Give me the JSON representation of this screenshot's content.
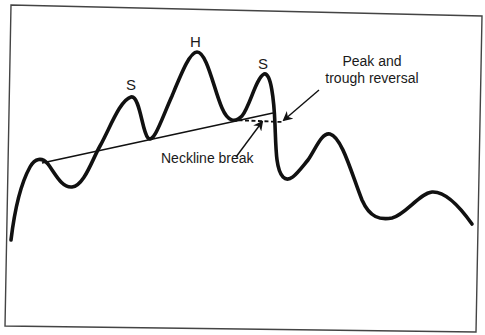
{
  "diagram": {
    "type": "head-and-shoulders pattern",
    "labels": {
      "left_shoulder": "S",
      "head": "H",
      "right_shoulder": "S",
      "neckline_break": "Neckline break",
      "peak_trough_reversal_line1": "Peak and",
      "peak_trough_reversal_line2": "trough reversal"
    },
    "colors": {
      "stroke": "#111111",
      "border": "#444444",
      "background": "#ffffff"
    },
    "elements": [
      "price-curve",
      "neckline",
      "dashed-horizontal-line",
      "neckline-break-arrow",
      "peak-trough-reversal-arrow",
      "frame-border"
    ]
  }
}
